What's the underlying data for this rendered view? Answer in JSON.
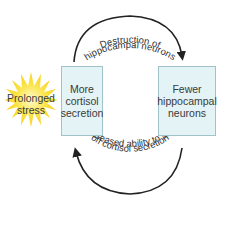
{
  "diagram": {
    "stimulus": {
      "line1": "Prolonged",
      "line2": "stress"
    },
    "left_box": {
      "line1": "More",
      "line2": "cortisol",
      "line3": "secretion"
    },
    "right_box": {
      "line1": "Fewer",
      "line2": "hippocampal",
      "line3": "neurons"
    },
    "top_arrow": {
      "line1": "Destruction of",
      "line2": "hippocampal neurons"
    },
    "bottom_arrow": {
      "line1": "Decreased ability to shut",
      "line2": "off cortisol secretion"
    },
    "colors": {
      "box_fill": "#e4f3f5",
      "box_border": "#9fc3c8",
      "burst": "#fbe44a",
      "arrow": "#222222"
    }
  }
}
